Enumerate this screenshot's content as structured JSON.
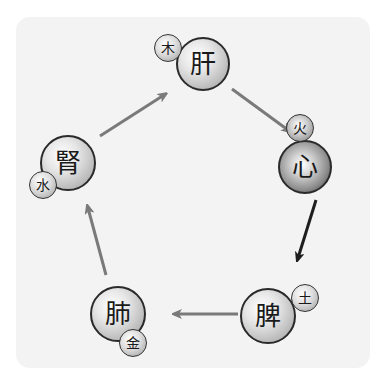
{
  "diagram": {
    "type": "five-elements-generating-cycle",
    "nodes": [
      {
        "id": "liver",
        "organ": "肝",
        "element": "木"
      },
      {
        "id": "heart",
        "organ": "心",
        "element": "火"
      },
      {
        "id": "spleen",
        "organ": "脾",
        "element": "土"
      },
      {
        "id": "lung",
        "organ": "肺",
        "element": "金"
      },
      {
        "id": "kidney",
        "organ": "腎",
        "element": "水"
      }
    ],
    "edges": [
      {
        "from": "肝",
        "to": "心",
        "color": "#7a7a7a"
      },
      {
        "from": "心",
        "to": "脾",
        "color": "#1e1e1e"
      },
      {
        "from": "脾",
        "to": "肺",
        "color": "#7a7a7a"
      },
      {
        "from": "肺",
        "to": "腎",
        "color": "#7a7a7a"
      },
      {
        "from": "腎",
        "to": "肝",
        "color": "#7a7a7a"
      }
    ]
  },
  "colors": {
    "panel_background": "#f3f3f3",
    "arrow_grey": "#7a7a7a",
    "arrow_dark": "#1e1e1e"
  }
}
